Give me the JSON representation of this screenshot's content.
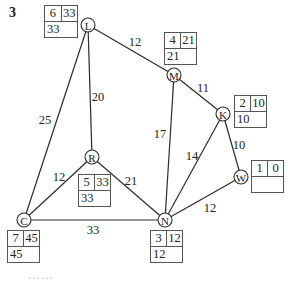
{
  "question_number": "3",
  "nodes": {
    "L": {
      "label": "L",
      "box": {
        "order": "6",
        "final_label": "33",
        "working": "33"
      }
    },
    "M": {
      "label": "M",
      "box": {
        "order": "4",
        "final_label": "21",
        "working": "21"
      }
    },
    "K": {
      "label": "K",
      "box": {
        "order": "2",
        "final_label": "10",
        "working": "10"
      }
    },
    "W": {
      "label": "W",
      "box": {
        "order": "1",
        "final_label": "0",
        "working": ""
      }
    },
    "R": {
      "label": "R",
      "box": {
        "order": "5",
        "final_label": "33",
        "working": "33"
      }
    },
    "C": {
      "label": "C",
      "box": {
        "order": "7",
        "final_label": "45",
        "working": "45"
      }
    },
    "N": {
      "label": "N",
      "box": {
        "order": "3",
        "final_label": "12",
        "working": "12"
      }
    }
  },
  "edges": {
    "L_M": "12",
    "L_R": "20",
    "L_C": "25",
    "M_K": "11",
    "M_N": "17",
    "K_N": "14",
    "K_W": "10",
    "W_N": "12",
    "R_C": "12",
    "R_N": "21",
    "C_N": "33"
  },
  "caption": "……"
}
